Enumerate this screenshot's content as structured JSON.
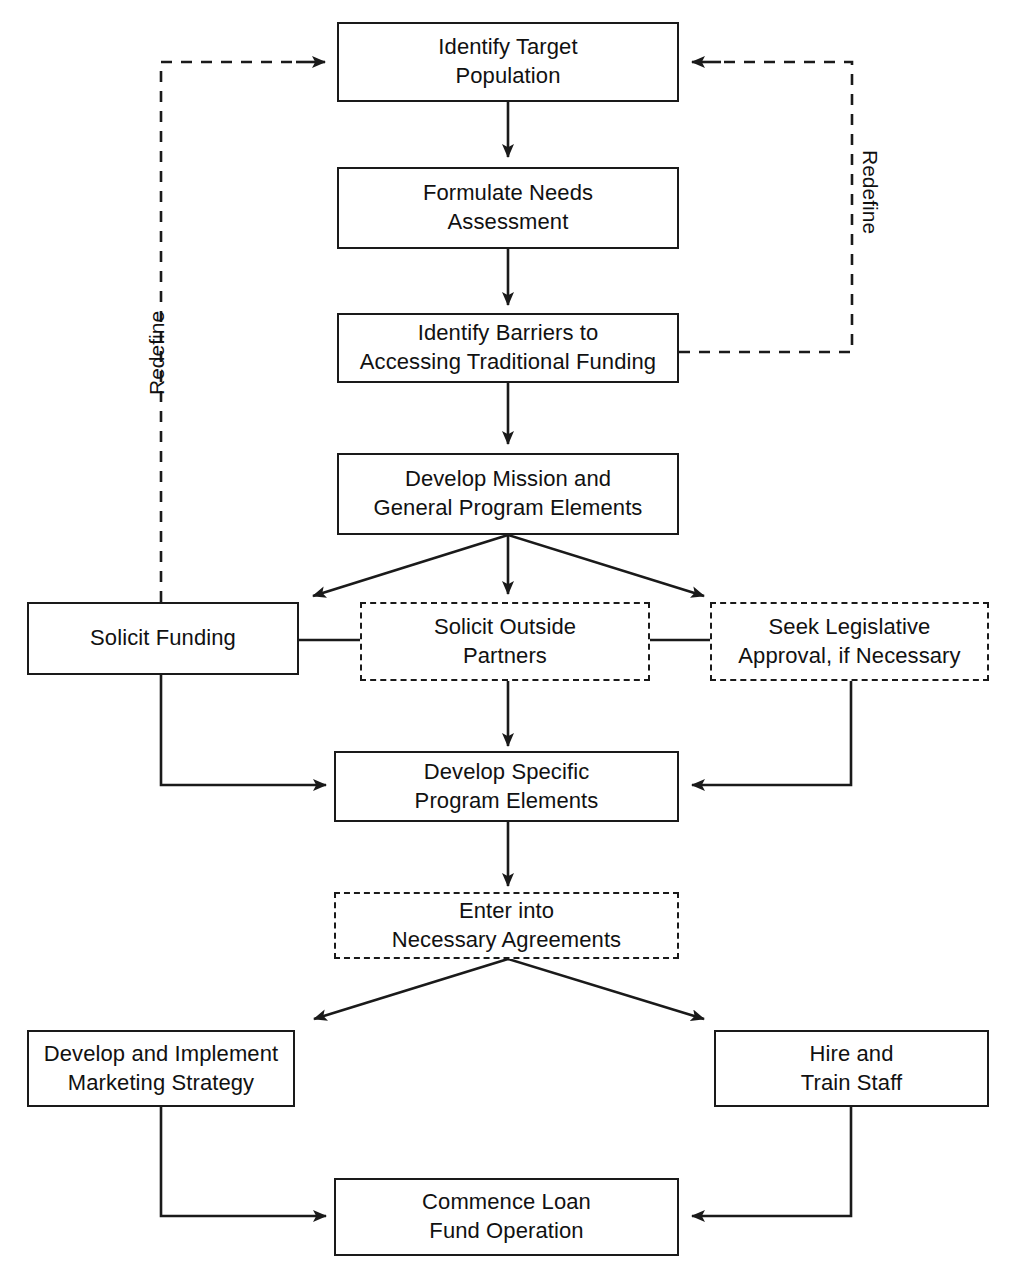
{
  "diagram": {
    "type": "flowchart",
    "nodes": [
      {
        "id": "identify-target-population",
        "label": "Identify Target\nPopulation",
        "style": "solid"
      },
      {
        "id": "formulate-needs-assessment",
        "label": "Formulate Needs\nAssessment",
        "style": "solid"
      },
      {
        "id": "identify-barriers",
        "label": "Identify Barriers to\nAccessing Traditional Funding",
        "style": "solid"
      },
      {
        "id": "develop-mission",
        "label": "Develop Mission and\nGeneral Program Elements",
        "style": "solid"
      },
      {
        "id": "solicit-funding",
        "label": "Solicit Funding",
        "style": "solid"
      },
      {
        "id": "solicit-outside-partners",
        "label": "Solicit Outside\nPartners",
        "style": "dashed"
      },
      {
        "id": "seek-legislative-approval",
        "label": "Seek Legislative\nApproval, if Necessary",
        "style": "dashed"
      },
      {
        "id": "develop-specific-program-elements",
        "label": "Develop Specific\nProgram Elements",
        "style": "solid"
      },
      {
        "id": "enter-into-agreements",
        "label": "Enter into\nNecessary Agreements",
        "style": "dashed"
      },
      {
        "id": "marketing-strategy",
        "label": "Develop and Implement\nMarketing Strategy",
        "style": "solid"
      },
      {
        "id": "hire-train-staff",
        "label": "Hire and\nTrain Staff",
        "style": "solid"
      },
      {
        "id": "commence-loan-fund",
        "label": "Commence Loan\nFund Operation",
        "style": "solid"
      }
    ],
    "edge_labels": [
      {
        "id": "redefine-left",
        "text": "Redefine"
      },
      {
        "id": "redefine-right",
        "text": "Redefine"
      }
    ],
    "colors": {
      "stroke": "#1a1a1a",
      "text": "#111111",
      "background": "#ffffff"
    }
  }
}
